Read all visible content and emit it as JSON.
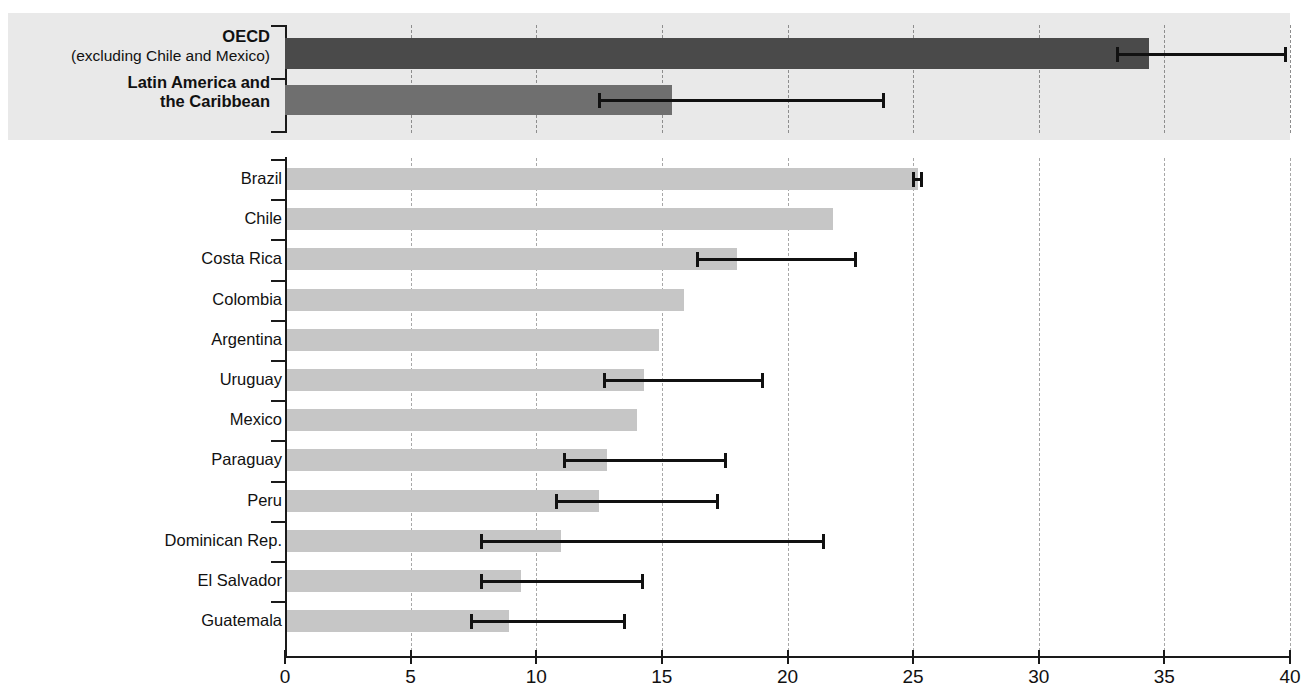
{
  "chart_data": {
    "type": "bar",
    "orientation": "horizontal",
    "title": "",
    "xlabel": "",
    "ylabel": "",
    "xlim": [
      0,
      40
    ],
    "xticks": [
      0,
      5,
      10,
      15,
      20,
      25,
      30,
      35,
      40
    ],
    "xtick_labels": [
      "0",
      "5",
      "10",
      "15",
      "20",
      "25",
      "30",
      "35",
      "40"
    ],
    "grid": "vertical-dashed",
    "legend": "none",
    "panels": [
      {
        "name": "aggregates",
        "background_color": "#e9e9e9",
        "categories": [
          "OECD (excluding Chile and Mexico)",
          "Latin America and the Caribbean"
        ],
        "series": [
          {
            "name": "aggregate",
            "items": [
              {
                "label": "OECD",
                "sublabel": "(excluding Chile and Mexico)",
                "value": 34.4,
                "err_low": 33.1,
                "err_high": 39.8,
                "color": "#4a4a4a"
              },
              {
                "label": "Latin America and",
                "sublabel": "the Caribbean",
                "value": 15.4,
                "err_low": 12.5,
                "err_high": 23.8,
                "color": "#6f6f6f"
              }
            ]
          }
        ]
      },
      {
        "name": "countries",
        "background_color": "#ffffff",
        "bar_color": "#c6c6c6",
        "categories": [
          "Brazil",
          "Chile",
          "Costa Rica",
          "Colombia",
          "Argentina",
          "Uruguay",
          "Mexico",
          "Paraguay",
          "Peru",
          "Dominican Rep.",
          "El Salvador",
          "Guatemala"
        ],
        "values": [
          25.2,
          21.8,
          18.0,
          15.9,
          14.9,
          14.3,
          14.0,
          12.8,
          12.5,
          11.0,
          9.4,
          8.9
        ],
        "err_low": [
          25.0,
          null,
          16.4,
          null,
          null,
          12.7,
          null,
          11.1,
          10.8,
          7.8,
          7.8,
          7.4
        ],
        "err_high": [
          25.3,
          null,
          22.7,
          null,
          null,
          19.0,
          null,
          17.5,
          17.2,
          21.4,
          14.2,
          13.5
        ],
        "items": [
          {
            "label": "Brazil",
            "value": 25.2,
            "err_low": 25.0,
            "err_high": 25.3
          },
          {
            "label": "Chile",
            "value": 21.8,
            "err_low": null,
            "err_high": null
          },
          {
            "label": "Costa Rica",
            "value": 18.0,
            "err_low": 16.4,
            "err_high": 22.7
          },
          {
            "label": "Colombia",
            "value": 15.9,
            "err_low": null,
            "err_high": null
          },
          {
            "label": "Argentina",
            "value": 14.9,
            "err_low": null,
            "err_high": null
          },
          {
            "label": "Uruguay",
            "value": 14.3,
            "err_low": 12.7,
            "err_high": 19.0
          },
          {
            "label": "Mexico",
            "value": 14.0,
            "err_low": null,
            "err_high": null
          },
          {
            "label": "Paraguay",
            "value": 12.8,
            "err_low": 11.1,
            "err_high": 17.5
          },
          {
            "label": "Peru",
            "value": 12.5,
            "err_low": 10.8,
            "err_high": 17.2
          },
          {
            "label": "Dominican Rep.",
            "value": 11.0,
            "err_low": 7.8,
            "err_high": 21.4
          },
          {
            "label": "El Salvador",
            "value": 9.4,
            "err_low": 7.8,
            "err_high": 14.2
          },
          {
            "label": "Guatemala",
            "value": 8.9,
            "err_low": 7.4,
            "err_high": 13.5
          }
        ]
      }
    ]
  },
  "colors": {
    "oecd_bar": "#4a4a4a",
    "lac_bar": "#6f6f6f",
    "country_bar": "#c6c6c6",
    "panel_background": "#e9e9e9",
    "gridline": "#a8a8a8",
    "axis": "#1a1a1a"
  }
}
